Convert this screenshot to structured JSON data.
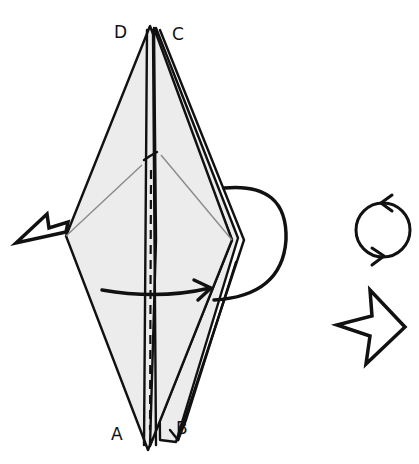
{
  "diagram": {
    "type": "origami-instruction",
    "step_description": "Turn model over; fold front flap from left to right",
    "corner_labels": {
      "top_left": "D",
      "top_right": "C",
      "bottom_left": "A",
      "bottom_right": "B"
    },
    "symbols": [
      {
        "name": "turn-over-icon",
        "meaning": "turn the model over"
      },
      {
        "name": "repeat-behind-icon",
        "meaning": "repeat behind / push"
      },
      {
        "name": "fold-arrow",
        "meaning": "fold flap to the right"
      },
      {
        "name": "wrap-around-arrow",
        "meaning": "fold around behind"
      },
      {
        "name": "valley-fold-line",
        "meaning": "dashed valley fold line"
      }
    ],
    "colors": {
      "paper": "#ececec",
      "line": "#111111",
      "crease": "#8a8a8a",
      "background": "#ffffff"
    }
  }
}
